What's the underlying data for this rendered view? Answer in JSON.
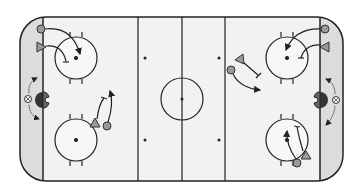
{
  "diagram": {
    "type": "hockey-rink-drill",
    "colors": {
      "ice": "#f2f2f2",
      "behind_net": "#dcdcdc",
      "lines": "#222222",
      "player_fill": "#9a9a9a",
      "net_fill": "#555555"
    },
    "rink": {
      "x": 20,
      "y": 17,
      "width": 323,
      "height": 164,
      "corner_radius": 26
    },
    "lines": {
      "goal_left_x": 43,
      "goal_right_x": 320,
      "blue_left_x": 138,
      "blue_right_x": 225,
      "center_x": 182
    },
    "faceoff_circles": [
      {
        "id": "left-top",
        "cx": 76,
        "cy": 58,
        "r": 21
      },
      {
        "id": "left-bottom",
        "cx": 76,
        "cy": 140,
        "r": 21
      },
      {
        "id": "right-top",
        "cx": 287,
        "cy": 58,
        "r": 21
      },
      {
        "id": "right-bottom",
        "cx": 287,
        "cy": 140,
        "r": 21
      },
      {
        "id": "center",
        "cx": 182,
        "cy": 99,
        "r": 21
      }
    ],
    "neutral_dots": [
      {
        "cx": 145,
        "cy": 58
      },
      {
        "cx": 219,
        "cy": 58
      },
      {
        "cx": 145,
        "cy": 140
      },
      {
        "cx": 219,
        "cy": 140
      }
    ],
    "players": [
      {
        "shape": "circle",
        "x": 41,
        "y": 29,
        "label": "forward"
      },
      {
        "shape": "triangle",
        "x": 41,
        "y": 47,
        "label": "defense"
      },
      {
        "shape": "triangle",
        "x": 95,
        "y": 123,
        "label": "defense"
      },
      {
        "shape": "circle",
        "x": 107,
        "y": 126,
        "label": "forward"
      },
      {
        "shape": "triangle",
        "x": 240,
        "y": 60,
        "label": "defense"
      },
      {
        "shape": "circle",
        "x": 231,
        "y": 70,
        "label": "forward"
      },
      {
        "shape": "circle",
        "x": 325,
        "y": 29,
        "label": "forward"
      },
      {
        "shape": "triangle",
        "x": 325,
        "y": 47,
        "label": "defense"
      },
      {
        "shape": "triangle",
        "x": 306,
        "y": 154,
        "label": "defense"
      },
      {
        "shape": "circle",
        "x": 297,
        "y": 163,
        "label": "forward"
      }
    ],
    "nets": [
      {
        "side": "left",
        "x": 43,
        "y": 100
      },
      {
        "side": "right",
        "x": 320,
        "y": 100
      }
    ],
    "coaches": [
      {
        "side": "left",
        "x": 28,
        "y": 99
      },
      {
        "side": "right",
        "x": 336,
        "y": 99
      }
    ]
  }
}
